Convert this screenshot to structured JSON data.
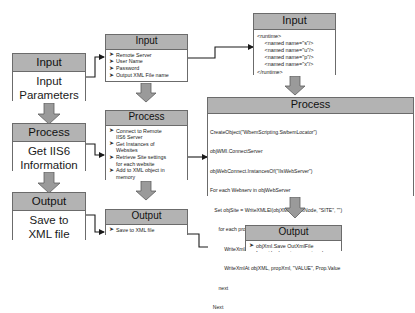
{
  "diagram": {
    "colors": {
      "header_fill": "#b3b3b3",
      "body_fill": "#ffffff",
      "border": "#6b6b6b",
      "arrow_fill": "#9a9a9a",
      "line": "#1a1a1a"
    },
    "columns": {
      "left": {
        "nodes": [
          {
            "id": "left-input",
            "header": "Input",
            "lines": [
              "Input",
              "Parameters"
            ]
          },
          {
            "id": "left-process",
            "header": "Process",
            "lines": [
              "Get IIS6",
              "Information"
            ]
          },
          {
            "id": "left-output",
            "header": "Output",
            "lines": [
              "Save to",
              "XML file"
            ]
          }
        ]
      },
      "middle": {
        "nodes": [
          {
            "id": "mid-input",
            "header": "Input",
            "bullets": [
              {
                "text": "Remote Server"
              },
              {
                "text": "User Name"
              },
              {
                "text": "Password"
              },
              {
                "text": "Output XML File name"
              }
            ]
          },
          {
            "id": "mid-process",
            "header": "Process",
            "bullets": [
              {
                "text": "Connect to Remote",
                "cont": "IIS6 Server"
              },
              {
                "text": "Get Instances of",
                "cont": "Websites"
              },
              {
                "text": "Retrieve Site settings",
                "cont": "for each website"
              },
              {
                "text": "Add to XML object in",
                "cont": "memory"
              }
            ]
          },
          {
            "id": "mid-output",
            "header": "Output",
            "bullets": [
              {
                "text": "Save to XML file"
              }
            ]
          }
        ]
      },
      "right": {
        "nodes": [
          {
            "id": "right-input",
            "header": "Input",
            "code": "<runtime>\n     <named name=\"s\"/>\n     <named name=\"u\"/>\n     <named name=\"p\"/>\n     <named name=\"x\"/>\n</runtime>"
          },
          {
            "id": "right-process",
            "header": "Process",
            "code_lines": [
              "CreateObject(\"WbemScripting.SwbemLocator\")",
              "objWMI.ConnectServer",
              "objWebConnect.InstancesOf(\"IIsWebServer\")",
              "For each Webserv in objWebServer",
              "   Set objSite = WriteXMLEl(objXML, RootNode, \"SITE\", \"\")",
              "      for each prop in webserv.Properties_",
              "          WriteXmlAt objXML, propXml, \"NAME\", Prop.Name",
              "          WriteXmlAt objXML, propXml, \"VALUE\", Prop.Value",
              "      next",
              "  Next"
            ]
          },
          {
            "id": "right-output",
            "header": "Output",
            "bullets": [
              {
                "text": "objXml.Save OutXmlFile"
              }
            ]
          }
        ]
      }
    }
  }
}
